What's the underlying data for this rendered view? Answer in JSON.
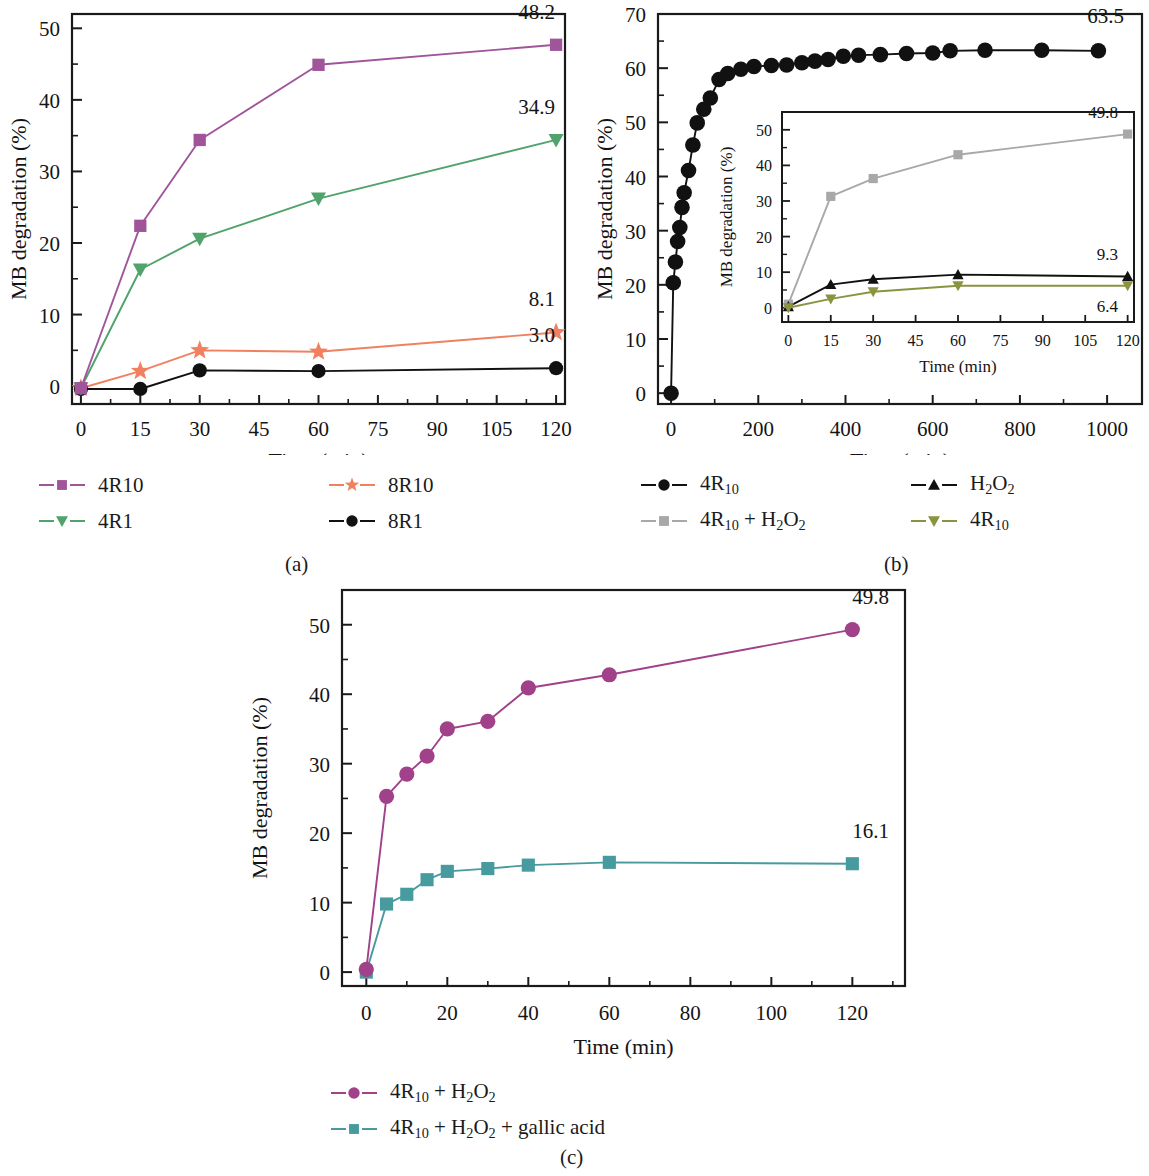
{
  "figure": {
    "panel_labels": {
      "a": "(a)",
      "b": "(b)",
      "c": "(c)"
    }
  },
  "colors": {
    "purple": "#a0559b",
    "green": "#4fa36b",
    "orange": "#f08060",
    "black": "#111111",
    "gray": "#a8a8a8",
    "olive": "#8a9440",
    "magenta": "#a0418a",
    "teal": "#479a9e",
    "axis": "#1a1a1a"
  },
  "panel_a": {
    "axis_x_label": "Time (min)",
    "axis_y_label": "MB degradation (%)",
    "x_ticks": [
      "0",
      "15",
      "30",
      "45",
      "60",
      "75",
      "90",
      "105",
      "120"
    ],
    "y_ticks": [
      "0",
      "10",
      "20",
      "30",
      "40",
      "50"
    ],
    "legend": [
      {
        "label": "4R10",
        "color": "#a0559b",
        "marker": "square"
      },
      {
        "label": "8R10",
        "color": "#f08060",
        "marker": "star"
      },
      {
        "label": "4R1",
        "color": "#4fa36b",
        "marker": "triangle-down"
      },
      {
        "label": "8R1",
        "color": "#111111",
        "marker": "circle"
      }
    ],
    "end_labels": [
      "48.2",
      "34.9",
      "8.1",
      "3.0"
    ]
  },
  "panel_b": {
    "axis_x_label": "Time (min)",
    "axis_y_label": "MB degradation (%)",
    "x_ticks": [
      "0",
      "200",
      "400",
      "600",
      "800",
      "1000"
    ],
    "y_ticks": [
      "0",
      "10",
      "20",
      "30",
      "40",
      "50",
      "60",
      "70"
    ],
    "end_label": "63.5",
    "legend": [
      {
        "label": "4R10",
        "color": "#111111",
        "marker": "circle"
      },
      {
        "label": "H2O2",
        "color": "#111111",
        "marker": "triangle-up"
      },
      {
        "label": "4R10 + H2O2",
        "color": "#a8a8a8",
        "marker": "square"
      },
      {
        "label": "4R10",
        "color": "#8a9440",
        "marker": "triangle-down"
      }
    ],
    "inset": {
      "axis_x_label": "Time (min)",
      "axis_y_label": "MB degradation (%)",
      "x_ticks": [
        "0",
        "15",
        "30",
        "45",
        "60",
        "75",
        "90",
        "105",
        "120"
      ],
      "y_ticks": [
        "0",
        "10",
        "20",
        "30",
        "40",
        "50"
      ],
      "end_labels": [
        "49.8",
        "9.3",
        "6.4"
      ]
    }
  },
  "panel_c": {
    "axis_x_label": "Time (min)",
    "axis_y_label": "MB degradation (%)",
    "x_ticks": [
      "0",
      "20",
      "40",
      "60",
      "80",
      "100",
      "120"
    ],
    "y_ticks": [
      "0",
      "10",
      "20",
      "30",
      "40",
      "50"
    ],
    "end_labels": [
      "49.8",
      "16.1"
    ],
    "legend": [
      {
        "label": "4R10 + H2O2",
        "color": "#a0418a",
        "marker": "circle"
      },
      {
        "label": "4R10 + H2O2 + gallic acid",
        "color": "#479a9e",
        "marker": "square"
      }
    ]
  },
  "chart_data": [
    {
      "id": "panel_a",
      "type": "line",
      "title": "(a)",
      "xlabel": "Time (min)",
      "ylabel": "MB degradation (%)",
      "x_scale": "categorical",
      "x": [
        0,
        15,
        30,
        45,
        60,
        75,
        90,
        105,
        120
      ],
      "xlim": [
        0,
        120
      ],
      "ylim": [
        -2.5,
        52
      ],
      "y_ticks": [
        0,
        10,
        20,
        30,
        40,
        50
      ],
      "grid": false,
      "legend_position": "below",
      "series": [
        {
          "name": "4R10",
          "color": "#a0559b",
          "marker": "square",
          "x": [
            0,
            15,
            30,
            60,
            120
          ],
          "values": [
            -0.3,
            22.4,
            34.4,
            44.9,
            47.7
          ],
          "end_annotation": "48.2"
        },
        {
          "name": "4R1",
          "color": "#4fa36b",
          "marker": "triangle-down",
          "x": [
            0,
            15,
            30,
            60,
            120
          ],
          "values": [
            -0.3,
            16.3,
            20.6,
            26.2,
            34.4
          ],
          "end_annotation": "34.9"
        },
        {
          "name": "8R10",
          "color": "#f08060",
          "marker": "star",
          "x": [
            0,
            15,
            30,
            60,
            120
          ],
          "values": [
            -0.3,
            2.1,
            5.0,
            4.8,
            7.5
          ],
          "end_annotation": "8.1"
        },
        {
          "name": "8R1",
          "color": "#111111",
          "marker": "circle",
          "x": [
            0,
            15,
            30,
            60,
            120
          ],
          "values": [
            -0.4,
            -0.4,
            2.2,
            2.1,
            2.5
          ],
          "end_annotation": "3.0"
        }
      ]
    },
    {
      "id": "panel_b",
      "type": "line",
      "title": "(b)",
      "xlabel": "Time (min)",
      "ylabel": "MB degradation (%)",
      "x_scale": "linear",
      "xlim": [
        -30,
        1080
      ],
      "ylim": [
        -2,
        70
      ],
      "x_ticks": [
        0,
        200,
        400,
        600,
        800,
        1000
      ],
      "y_ticks": [
        0,
        10,
        20,
        30,
        40,
        50,
        60,
        70
      ],
      "grid": false,
      "legend_position": "below",
      "series": [
        {
          "name": "4R10",
          "color": "#111111",
          "marker": "circle",
          "x": [
            0,
            5,
            10,
            15,
            20,
            25,
            30,
            40,
            50,
            60,
            75,
            90,
            110,
            130,
            160,
            190,
            230,
            265,
            300,
            330,
            360,
            395,
            430,
            480,
            540,
            600,
            640,
            720,
            850,
            980
          ],
          "values": [
            0,
            20.4,
            24.2,
            28.0,
            30.6,
            34.3,
            37.0,
            41.1,
            45.8,
            49.9,
            52.4,
            54.5,
            57.9,
            59.0,
            59.8,
            60.3,
            60.5,
            60.6,
            61.0,
            61.3,
            61.6,
            62.2,
            62.4,
            62.5,
            62.7,
            62.8,
            63.2,
            63.3,
            63.3,
            63.2
          ],
          "end_annotation": "63.5"
        }
      ],
      "inset": {
        "type": "line",
        "xlabel": "Time (min)",
        "ylabel": "MB degradation (%)",
        "x_scale": "categorical",
        "x": [
          0,
          15,
          30,
          45,
          60,
          75,
          90,
          105,
          120
        ],
        "ylim": [
          -4,
          55
        ],
        "y_ticks": [
          0,
          10,
          20,
          30,
          40,
          50
        ],
        "series": [
          {
            "name": "4R10 + H2O2",
            "color": "#a8a8a8",
            "marker": "square",
            "x": [
              0,
              15,
              30,
              60,
              120
            ],
            "values": [
              1.0,
              31.3,
              36.3,
              43.0,
              48.8
            ],
            "end_annotation": "49.8"
          },
          {
            "name": "H2O2",
            "color": "#111111",
            "marker": "triangle-up",
            "x": [
              0,
              15,
              30,
              60,
              120
            ],
            "values": [
              0.3,
              6.5,
              8.0,
              9.3,
              8.8
            ],
            "end_annotation": "9.3"
          },
          {
            "name": "4R10",
            "color": "#8a9440",
            "marker": "triangle-down",
            "x": [
              0,
              15,
              30,
              60,
              120
            ],
            "values": [
              0.0,
              2.5,
              4.5,
              6.2,
              6.2
            ],
            "end_annotation": "6.4"
          }
        ]
      }
    },
    {
      "id": "panel_c",
      "type": "line",
      "title": "(c)",
      "xlabel": "Time (min)",
      "ylabel": "MB degradation (%)",
      "x_scale": "linear",
      "xlim": [
        -6,
        133
      ],
      "ylim": [
        -2,
        55
      ],
      "x_ticks": [
        0,
        20,
        40,
        60,
        80,
        100,
        120
      ],
      "y_ticks": [
        0,
        10,
        20,
        30,
        40,
        50
      ],
      "grid": false,
      "legend_position": "below",
      "series": [
        {
          "name": "4R10 + H2O2",
          "color": "#a0418a",
          "marker": "circle",
          "x": [
            0,
            5,
            10,
            15,
            20,
            30,
            40,
            60,
            120
          ],
          "values": [
            0.4,
            25.3,
            28.5,
            31.1,
            35.0,
            36.1,
            40.9,
            42.8,
            49.3
          ],
          "end_annotation": "49.8"
        },
        {
          "name": "4R10 + H2O2 + gallic acid",
          "color": "#479a9e",
          "marker": "square",
          "x": [
            0,
            5,
            10,
            15,
            20,
            30,
            40,
            60,
            120
          ],
          "values": [
            0.0,
            9.8,
            11.2,
            13.3,
            14.5,
            14.9,
            15.4,
            15.8,
            15.6
          ],
          "end_annotation": "16.1"
        }
      ]
    }
  ]
}
